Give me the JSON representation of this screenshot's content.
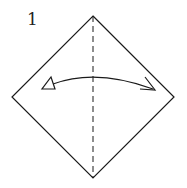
{
  "diagram": {
    "type": "origami-step",
    "step_number": "1",
    "colors": {
      "line": "#1a1a1a",
      "background": "#ffffff"
    },
    "square": {
      "orientation": "diamond",
      "vertices": {
        "top": [
          93,
          16
        ],
        "right": [
          174,
          97
        ],
        "bottom": [
          93,
          178
        ],
        "left": [
          12,
          97
        ]
      }
    },
    "valley_fold_line": {
      "style": "dashed",
      "from": [
        93,
        16
      ],
      "to": [
        93,
        178
      ]
    },
    "fold_arrow": {
      "meaning": "fold and unfold",
      "start": [
        42,
        89
      ],
      "control": [
        95,
        65
      ],
      "end": [
        155,
        90
      ],
      "start_head": "hollow-triangle",
      "end_head": "open-barb"
    }
  }
}
